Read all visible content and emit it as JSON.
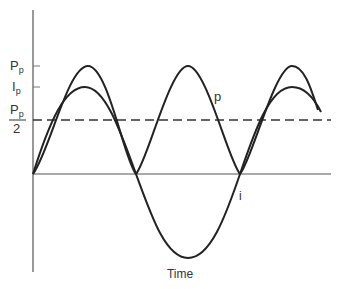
{
  "diagram": {
    "xlabel": "Time",
    "ylabels": {
      "pp_main": "P",
      "pp_sub": "p",
      "ip_main": "I",
      "ip_sub": "p",
      "half_main": "P",
      "half_sub": "p",
      "half_den": "2"
    },
    "curve_labels": {
      "power": "p",
      "current": "i"
    },
    "colors": {
      "line": "#222222",
      "axis": "#444444"
    }
  }
}
